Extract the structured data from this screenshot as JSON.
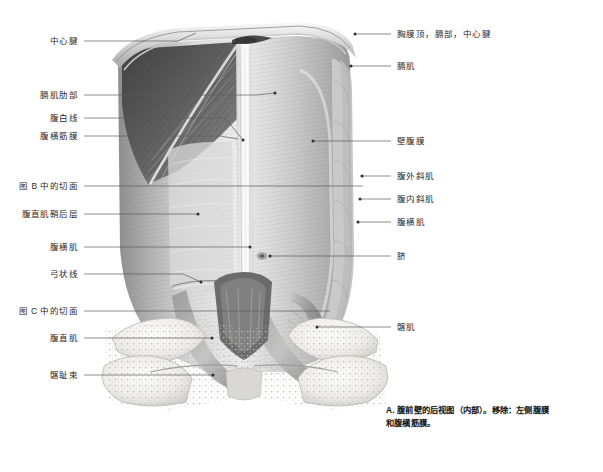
{
  "figure": {
    "title_id": "A",
    "caption": "A. 腹前壁的后视图（内部）。移除：左侧腹膜和腹横筋膜。",
    "caption_line1": "A. 腹前壁的后视图（内部）。移除：左侧腹膜",
    "caption_line2": "和腹横筋膜。",
    "view_description": "腹前壁的后视图（内部）",
    "colors": {
      "background": "#ffffff",
      "leader_line": "#5c5c5c",
      "label_text": "#2b2b2b",
      "caption_text": "#141414",
      "muscle_light": "#e8e8e8",
      "muscle_mid": "#b9b9b9",
      "muscle_dark": "#6e6e6e",
      "diaphragm_dark": "#4a4a4a",
      "bone": "#f2f1ee",
      "bone_outline": "#9a9a9a"
    }
  },
  "labels_left": [
    {
      "id": "central-tendon",
      "text": "中心腱",
      "x": 78,
      "y": 41,
      "line_to_x": 196,
      "line_to_y": 33,
      "dot": false
    },
    {
      "id": "diaphragm-costal-part",
      "text": "膈肌肋部",
      "x": 78,
      "y": 95,
      "line_to_x": 275,
      "line_to_y": 93,
      "dot": true
    },
    {
      "id": "linea-alba",
      "text": "腹白线",
      "x": 78,
      "y": 118,
      "line_to_x": 243,
      "line_to_y": 140,
      "dot": true
    },
    {
      "id": "transversalis-fascia",
      "text": "腹横筋膜",
      "x": 78,
      "y": 136,
      "line_to_x": 238,
      "line_to_y": 139,
      "dot": false
    },
    {
      "id": "section-plane-b",
      "text": "图 B 中的切面",
      "x": 78,
      "y": 186,
      "line_to_x": 363,
      "line_to_y": 186,
      "dot": false
    },
    {
      "id": "rectus-sheath-post-layer",
      "text": "腹直肌鞘后层",
      "x": 78,
      "y": 214,
      "line_to_x": 198,
      "line_to_y": 214,
      "dot": true
    },
    {
      "id": "transversus-abdominis-l",
      "text": "腹横肌",
      "x": 78,
      "y": 247,
      "line_to_x": 250,
      "line_to_y": 247,
      "dot": true
    },
    {
      "id": "arcuate-line",
      "text": "弓状线",
      "x": 78,
      "y": 274,
      "line_to_x": 201,
      "line_to_y": 282,
      "dot": true
    },
    {
      "id": "section-plane-c",
      "text": "图 C 中的切面",
      "x": 78,
      "y": 311,
      "line_to_x": 330,
      "line_to_y": 311,
      "dot": false
    },
    {
      "id": "rectus-abdominis",
      "text": "腹直肌",
      "x": 78,
      "y": 338,
      "line_to_x": 212,
      "line_to_y": 338,
      "dot": true
    },
    {
      "id": "iliopubic-tract",
      "text": "髂耻束",
      "x": 78,
      "y": 375,
      "line_to_x": 213,
      "line_to_y": 375,
      "dot": true
    }
  ],
  "labels_right": [
    {
      "id": "pleural-cupula-diaphragm",
      "text": "胸膜顶，膈部，中心腱",
      "x": 397,
      "y": 34,
      "line_to_x": 355,
      "line_to_y": 34,
      "dot": true
    },
    {
      "id": "diaphragm",
      "text": "膈肌",
      "x": 397,
      "y": 66,
      "line_to_x": 351,
      "line_to_y": 66,
      "dot": true
    },
    {
      "id": "parietal-peritoneum",
      "text": "壁腹膜",
      "x": 397,
      "y": 141,
      "line_to_x": 313,
      "line_to_y": 141,
      "dot": true
    },
    {
      "id": "external-oblique",
      "text": "腹外斜肌",
      "x": 397,
      "y": 176,
      "line_to_x": 362,
      "line_to_y": 176,
      "dot": true
    },
    {
      "id": "internal-oblique",
      "text": "腹内斜肌",
      "x": 397,
      "y": 199,
      "line_to_x": 360,
      "line_to_y": 199,
      "dot": true
    },
    {
      "id": "transversus-abdominis-r",
      "text": "腹横肌",
      "x": 397,
      "y": 222,
      "line_to_x": 358,
      "line_to_y": 222,
      "dot": true
    },
    {
      "id": "umbilicus",
      "text": "脐",
      "x": 397,
      "y": 256,
      "line_to_x": 270,
      "line_to_y": 256,
      "dot": true
    },
    {
      "id": "iliacus",
      "text": "髂肌",
      "x": 397,
      "y": 327,
      "line_to_x": 317,
      "line_to_y": 327,
      "dot": true
    }
  ]
}
